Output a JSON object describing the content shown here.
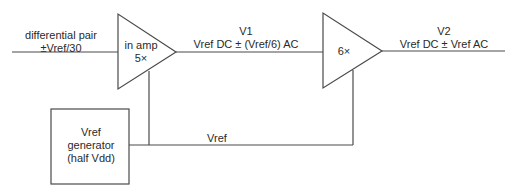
{
  "diagram": {
    "input": {
      "line1": "differential pair",
      "line2": "±Vref/30"
    },
    "amp1": {
      "line1": "in amp",
      "line2": "5×"
    },
    "node_v1": {
      "name": "V1",
      "value": "Vref DC ± (Vref/6) AC"
    },
    "amp2": {
      "label": "6×"
    },
    "node_v2": {
      "name": "V2",
      "value": "Vref DC ± Vref AC"
    },
    "vref_bus": {
      "label": "Vref"
    },
    "generator": {
      "line1": "Vref",
      "line2": "generator",
      "line3": "(half Vdd)"
    },
    "colors": {
      "stroke": "#4a4a4a",
      "text": "#2a2a2a",
      "background": "#ffffff"
    }
  }
}
